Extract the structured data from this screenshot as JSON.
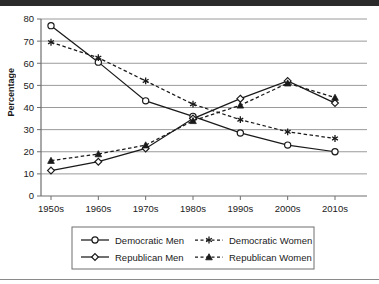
{
  "chart_data": {
    "type": "line",
    "title": "",
    "subtitle": "",
    "xlabel": "",
    "ylabel": "Percentage",
    "categories": [
      "1950s",
      "1960s",
      "1970s",
      "1980s",
      "1990s",
      "2000s",
      "2010s"
    ],
    "ylim": [
      0,
      80
    ],
    "yticks": [
      0,
      10,
      20,
      30,
      40,
      50,
      60,
      70,
      80
    ],
    "ytick_labels": [
      "0",
      "10",
      "20",
      "30",
      "40",
      "50",
      "60",
      "70",
      "80"
    ],
    "grid": "horizontal",
    "legend_position": "bottom",
    "series": [
      {
        "name": "Democratic Men",
        "values": [
          77,
          60.5,
          43,
          36,
          28.5,
          23,
          20
        ],
        "line_style": "solid",
        "marker": "open-circle",
        "color": "#1a1a1a"
      },
      {
        "name": "Republican Men",
        "values": [
          11.5,
          15.5,
          21.5,
          35,
          44,
          52,
          42
        ],
        "line_style": "solid",
        "marker": "open-diamond",
        "color": "#1a1a1a"
      },
      {
        "name": "Democratic Women",
        "values": [
          69.5,
          62.5,
          52,
          41.5,
          34.5,
          29,
          26
        ],
        "line_style": "dashed",
        "marker": "asterisk",
        "color": "#1a1a1a"
      },
      {
        "name": "Republican Women",
        "values": [
          16,
          19,
          23,
          34,
          41,
          51,
          44.5
        ],
        "line_style": "dashed",
        "marker": "filled-triangle",
        "color": "#1a1a1a"
      }
    ]
  },
  "legend": {
    "entries": [
      {
        "label": "Democratic Men"
      },
      {
        "label": "Republican Men"
      },
      {
        "label": "Democratic Women"
      },
      {
        "label": "Republican Women"
      }
    ]
  },
  "colors": {
    "ink": "#1a1a1a",
    "grid": "#9a9a9a",
    "axis": "#6e6e6e",
    "background": "#ffffff",
    "top_band": "#2b2b2b",
    "bottom_rule": "#8a8a8a"
  }
}
